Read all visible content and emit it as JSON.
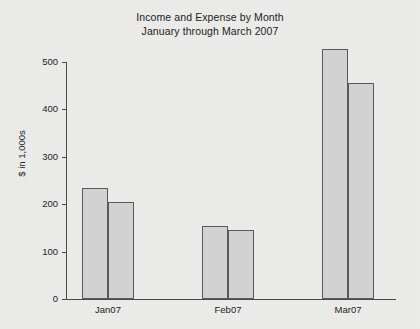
{
  "chart_data": {
    "type": "bar",
    "title": "Income and Expense by Month",
    "subtitle": "January through March 2007",
    "title_lines": [
      "Income and Expense by Month",
      "January through March 2007"
    ],
    "categories": [
      "Jan07",
      "Feb07",
      "Mar07"
    ],
    "series": [
      {
        "name": "Income",
        "values": [
          234,
          153,
          528
        ]
      },
      {
        "name": "Expense",
        "values": [
          204,
          146,
          456
        ]
      }
    ],
    "xlabel": "",
    "ylabel": "$ in 1,000s",
    "ylim": [
      0,
      500
    ],
    "yticks": [
      0,
      100,
      200,
      300,
      400,
      500
    ],
    "ytick_labels": [
      "0",
      "100",
      "200",
      "300",
      "400",
      "500"
    ],
    "grid": false,
    "legend": false,
    "bar_fill_color": "#d2d2d2",
    "bar_border_color": "#5a5a5a",
    "background_color": "#ededec",
    "axis_color": "#4a4a4a"
  }
}
